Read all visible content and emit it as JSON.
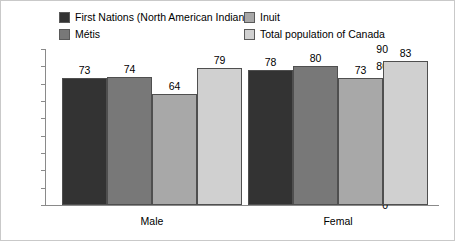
{
  "chart_data": {
    "type": "bar",
    "title": "",
    "xlabel": "",
    "ylabel": "",
    "categories": [
      "Male",
      "Femal"
    ],
    "series": [
      {
        "name": "First Nations (North American Indian)",
        "values": [
          73,
          78
        ],
        "color": "#333333"
      },
      {
        "name": "Métis",
        "values": [
          74,
          80
        ],
        "color": "#787878"
      },
      {
        "name": "Inuit",
        "values": [
          64,
          73
        ],
        "color": "#a8a8a8"
      },
      {
        "name": "Total population of Canada",
        "values": [
          79,
          83
        ],
        "color": "#d0d0d0"
      }
    ],
    "ylim": [
      0,
      90
    ],
    "ytick_step": 10,
    "yticks": [
      90,
      80,
      70,
      60,
      50,
      40,
      30,
      20,
      10,
      0
    ],
    "grid": false,
    "legend_position": "top"
  },
  "legend": {
    "items": [
      {
        "label": "First Nations (North American Indian)",
        "color": "#333333"
      },
      {
        "label": "Inuit",
        "color": "#a8a8a8"
      },
      {
        "label": "Métis",
        "color": "#787878"
      },
      {
        "label": "Total population of Canada",
        "color": "#d0d0d0"
      }
    ]
  },
  "axis": {
    "y_tick_labels": [
      "90",
      "80",
      "70",
      "60",
      "50",
      "40",
      "30",
      "20",
      "10",
      "0"
    ],
    "x_category_labels": [
      "Male",
      "Femal"
    ]
  },
  "bar_value_labels": {
    "male": [
      "73",
      "74",
      "64",
      "79"
    ],
    "female": [
      "78",
      "80",
      "73",
      "83"
    ]
  }
}
